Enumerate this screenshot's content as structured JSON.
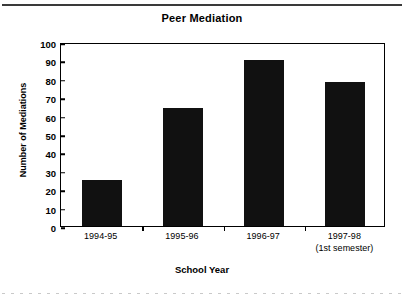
{
  "chart_data": {
    "type": "bar",
    "title": "Peer Mediation",
    "xlabel": "School Year",
    "ylabel": "Number of Mediations",
    "categories": [
      "1994-95",
      "1995-96",
      "1996-97",
      "1997-98"
    ],
    "category_sublabels": [
      "",
      "",
      "",
      "(1st semester)"
    ],
    "values": [
      25,
      64,
      90,
      78
    ],
    "ylim": [
      0,
      100
    ],
    "ytick_labels": [
      "100",
      "90",
      "80",
      "70",
      "60",
      "50",
      "40",
      "30",
      "20",
      "10",
      "0"
    ],
    "ytick_values": [
      100,
      90,
      80,
      70,
      60,
      50,
      40,
      30,
      20,
      10,
      0
    ],
    "grid": false,
    "legend": null,
    "bar_color": "#111111",
    "axis_color": "#000000"
  }
}
